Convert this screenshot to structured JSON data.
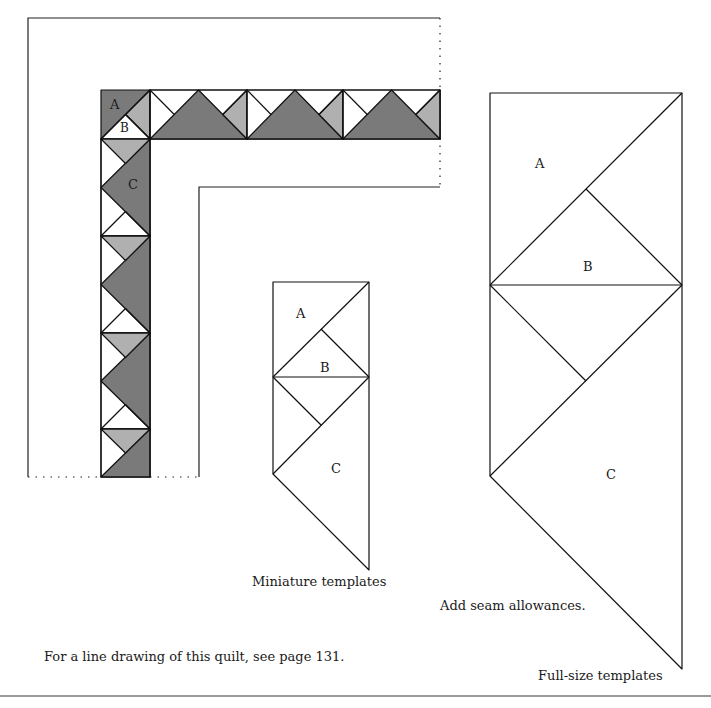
{
  "colors": {
    "dark": "#7a7a7a",
    "light": "#b0b0b0",
    "white": "#ffffff",
    "line": "#111111"
  },
  "quilt_diagram": {
    "labels": {
      "a": "A",
      "b": "B",
      "c": "C"
    }
  },
  "miniature_templates": {
    "labels": {
      "a": "A",
      "b": "B",
      "c": "C"
    },
    "caption": "Miniature templates"
  },
  "fullsize_templates": {
    "labels": {
      "a": "A",
      "b": "B",
      "c": "C"
    },
    "caption": "Full-size templates"
  },
  "notes": {
    "seam": "Add seam allowances.",
    "line_drawing": "For a line drawing of this quilt, see page 131."
  }
}
